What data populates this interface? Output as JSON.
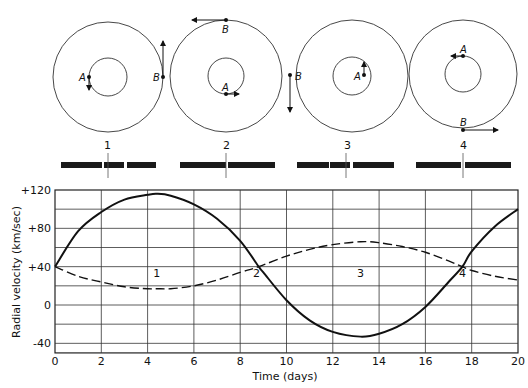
{
  "orbit_diagrams": [
    {
      "label": "1",
      "star_a": "A",
      "star_b": "B"
    },
    {
      "label": "2",
      "star_a": "A",
      "star_b": "B"
    },
    {
      "label": "3",
      "star_a": "A",
      "star_b": "B"
    },
    {
      "label": "4",
      "star_a": "A",
      "star_b": "B"
    }
  ],
  "chart_data": {
    "type": "line",
    "title": "",
    "xlabel": "Time (days)",
    "ylabel": "Radial velocity (km/sec)",
    "xlim": [
      0,
      20
    ],
    "ylim": [
      -50,
      120
    ],
    "x_ticks": [
      "0",
      "2",
      "4",
      "6",
      "8",
      "10",
      "12",
      "14",
      "16",
      "18",
      "20"
    ],
    "y_ticks": [
      "+120",
      "+80",
      "+40",
      "0",
      "-40"
    ],
    "grid": true,
    "series": [
      {
        "name": "Star B (solid)",
        "style": "solid",
        "x": [
          0,
          1,
          2,
          3,
          4,
          4.4,
          5,
          6,
          7,
          8,
          8.8,
          9,
          10,
          11,
          12,
          13.2,
          14,
          15,
          16,
          17,
          17.6,
          18,
          19,
          20
        ],
        "y": [
          40,
          77,
          97,
          110,
          115,
          116,
          114,
          105,
          90,
          67,
          40,
          34,
          5,
          -16,
          -28,
          -33,
          -30,
          -20,
          -2,
          24,
          40,
          56,
          82,
          100
        ]
      },
      {
        "name": "Star A (dashed)",
        "style": "dashed",
        "x": [
          0,
          1,
          2,
          3,
          4,
          4.4,
          5,
          6,
          7,
          8,
          8.8,
          10,
          11,
          12,
          13.2,
          14,
          15,
          16,
          17,
          17.6,
          18,
          19,
          20
        ],
        "y": [
          40,
          30,
          24,
          19,
          17,
          17,
          17,
          20,
          26,
          34,
          40,
          51,
          58,
          63,
          66,
          65,
          61,
          55,
          46,
          40,
          36,
          30,
          26
        ]
      }
    ],
    "annotations": [
      {
        "text": "1",
        "x": 4.4,
        "y": 33
      },
      {
        "text": "2",
        "x": 8.7,
        "y": 33
      },
      {
        "text": "3",
        "x": 13.2,
        "y": 33
      },
      {
        "text": "4",
        "x": 17.6,
        "y": 33
      }
    ]
  }
}
